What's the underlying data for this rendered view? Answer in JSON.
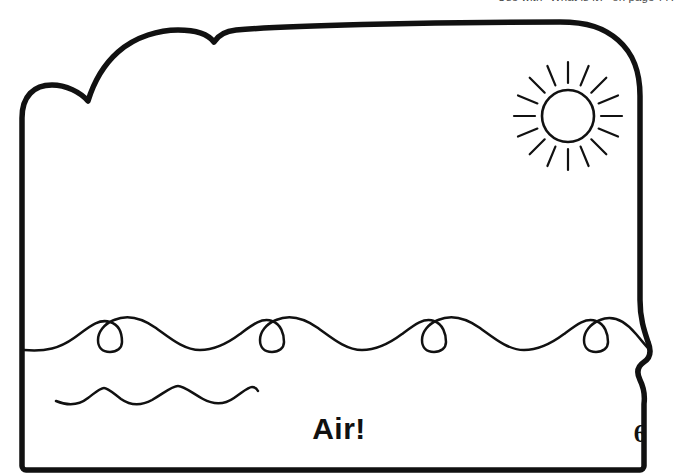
{
  "page": {
    "background_color": "#ffffff",
    "ink_color": "#111111",
    "header_note": "Use with \"What is it?\" on page 77.",
    "caption": "Air!",
    "folio": "6"
  },
  "artwork": {
    "title": "Air!",
    "description": "Line-art coloring page: a cloud-edged card frame containing a sun in the sky above ocean waves.",
    "style": "black outline line art on white",
    "elements": [
      {
        "name": "card-outline",
        "label": "Card border with scalloped cloud top and wavy right edge",
        "stroke_color": "#111111",
        "stroke_width": 5
      },
      {
        "name": "sun",
        "label": "Sun",
        "center_x": 568,
        "center_y": 116,
        "radius": 26,
        "ray_count": 16,
        "ray_inner": 33,
        "ray_outer": 52,
        "stroke_color": "#111111",
        "stroke_width": 2.4
      },
      {
        "name": "ocean-wave-main",
        "label": "Main wave line",
        "crest_count": 8,
        "baseline_y": 348,
        "stroke_color": "#111111",
        "stroke_width": 2.4
      },
      {
        "name": "ocean-wave-small",
        "label": "Small wave line",
        "crest_count": 3,
        "baseline_y": 402,
        "stroke_color": "#111111",
        "stroke_width": 2.4
      }
    ]
  }
}
